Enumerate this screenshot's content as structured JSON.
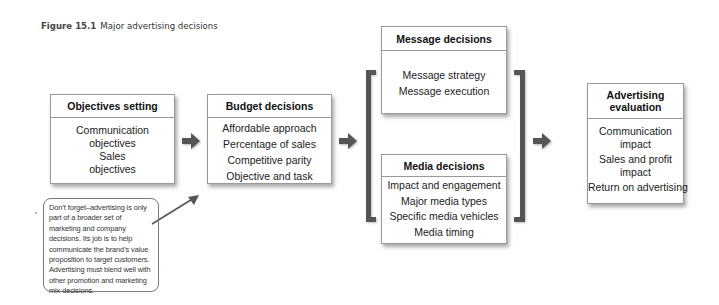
{
  "caption": {
    "figure_label": "Figure 15.1",
    "title": "Major advertising decisions"
  },
  "boxes": {
    "objectives": {
      "title": "Objectives setting",
      "items": [
        "Communication objectives",
        "Sales objectives"
      ]
    },
    "budget": {
      "title": "Budget decisions",
      "items": [
        "Affordable approach",
        "Percentage of sales",
        "Competitive parity",
        "Objective and task"
      ]
    },
    "message": {
      "title": "Message decisions",
      "items": [
        "Message strategy",
        "Message execution"
      ]
    },
    "media": {
      "title": "Media decisions",
      "items": [
        "Impact and engagement",
        "Major media types",
        "Specific media vehicles",
        "Media timing"
      ]
    },
    "evaluation": {
      "title": "Advertising evaluation",
      "items": [
        "Communication impact",
        "Sales and profit impact",
        "Return on advertising"
      ]
    }
  },
  "note": {
    "text": "Don’t forget–advertising is only part of a broader set of marketing and company decisions. Its job is to help communicate the brand’s value proposition to target customers. Advertising must blend well with other promotion and marketing mix decisions."
  },
  "colors": {
    "arrow": "#555555",
    "bracket": "#555555",
    "box_border": "#9a9a9a"
  },
  "icons": {
    "flow_arrow": "arrow-right-icon",
    "callout_arrow": "arrow-up-right-icon"
  }
}
